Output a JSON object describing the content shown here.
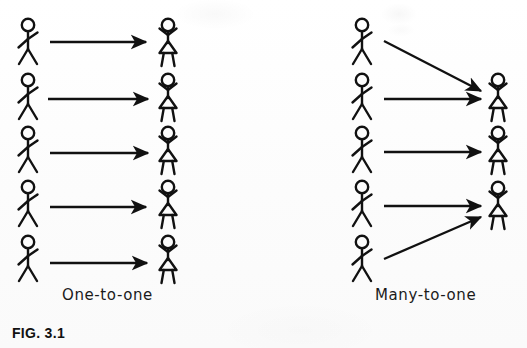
{
  "figure": {
    "number_label": "FIG. 3.1",
    "background_color": "#fdfdfd",
    "ink_color": "#111111",
    "width": 527,
    "height": 348
  },
  "diagram_data": {
    "type": "diagram",
    "subtype": "mapping-cardinality-illustration",
    "description": "Two stick-figure mapping diagrams contrasting one-to-one and many-to-one correspondences.",
    "row_y_centers": [
      45,
      100,
      153,
      207,
      262
    ],
    "panels": [
      {
        "id": "one-to-one",
        "caption": "One-to-one",
        "source_column": {
          "label": "source",
          "figure_kind": "male-stick-figure",
          "x": 28,
          "count": 5,
          "rows": [
            1,
            2,
            3,
            4,
            5
          ]
        },
        "target_column": {
          "label": "target",
          "figure_kind": "female-stick-figure",
          "x": 168,
          "count": 5,
          "rows": [
            1,
            2,
            3,
            4,
            5
          ]
        },
        "arrows": [
          {
            "from_row": 1,
            "to_row": 1,
            "style": "horizontal"
          },
          {
            "from_row": 2,
            "to_row": 2,
            "style": "horizontal"
          },
          {
            "from_row": 3,
            "to_row": 3,
            "style": "horizontal"
          },
          {
            "from_row": 4,
            "to_row": 4,
            "style": "horizontal"
          },
          {
            "from_row": 5,
            "to_row": 5,
            "style": "horizontal"
          }
        ]
      },
      {
        "id": "many-to-one",
        "caption": "Many-to-one",
        "source_column": {
          "label": "source",
          "figure_kind": "male-stick-figure",
          "x": 362,
          "count": 5,
          "rows": [
            1,
            2,
            3,
            4,
            5
          ]
        },
        "target_column": {
          "label": "target",
          "figure_kind": "female-stick-figure",
          "x": 498,
          "count": 3,
          "rows": [
            2,
            3,
            4
          ]
        },
        "arrows": [
          {
            "from_row": 1,
            "to_row": 2,
            "style": "diagonal-down"
          },
          {
            "from_row": 2,
            "to_row": 2,
            "style": "horizontal"
          },
          {
            "from_row": 3,
            "to_row": 3,
            "style": "horizontal"
          },
          {
            "from_row": 4,
            "to_row": 4,
            "style": "horizontal"
          },
          {
            "from_row": 5,
            "to_row": 4,
            "style": "diagonal-up"
          }
        ]
      }
    ]
  }
}
